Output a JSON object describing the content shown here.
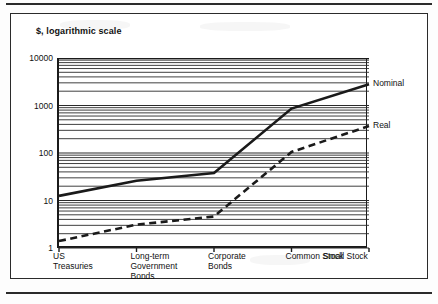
{
  "figure": {
    "title": "$, logarithmic scale"
  },
  "chart_data": {
    "type": "line",
    "title": "$, logarithmic scale",
    "xlabel": "",
    "ylabel": "$, logarithmic scale",
    "yscale": "log",
    "ylim": [
      1,
      10000
    ],
    "ytick_labels": [
      "10000",
      "1000",
      "100",
      "10",
      "1"
    ],
    "ytick_values": [
      10000,
      1000,
      100,
      10,
      1
    ],
    "grid": "horizontal log minor gridlines",
    "legend_position": "right of plot, inline at line ends",
    "categories": [
      "US Treasuries",
      "Long-term Government Bonds",
      "Corporate Bonds",
      "Common Stock",
      "Small Stock"
    ],
    "category_lines": [
      [
        "US",
        "Treasuries"
      ],
      [
        "Long-term",
        "Government",
        "Bonds"
      ],
      [
        "Corporate",
        "Bonds"
      ],
      [
        "Common Stock"
      ],
      [
        "Small Stock"
      ]
    ],
    "series": [
      {
        "name": "Nominal",
        "style": "solid",
        "color": "#1a1a1a",
        "values": [
          12.5,
          26,
          38,
          860,
          2800
        ]
      },
      {
        "name": "Real",
        "style": "dashed",
        "color": "#1a1a1a",
        "values": [
          1.4,
          3.1,
          4.6,
          105,
          370
        ]
      }
    ]
  }
}
